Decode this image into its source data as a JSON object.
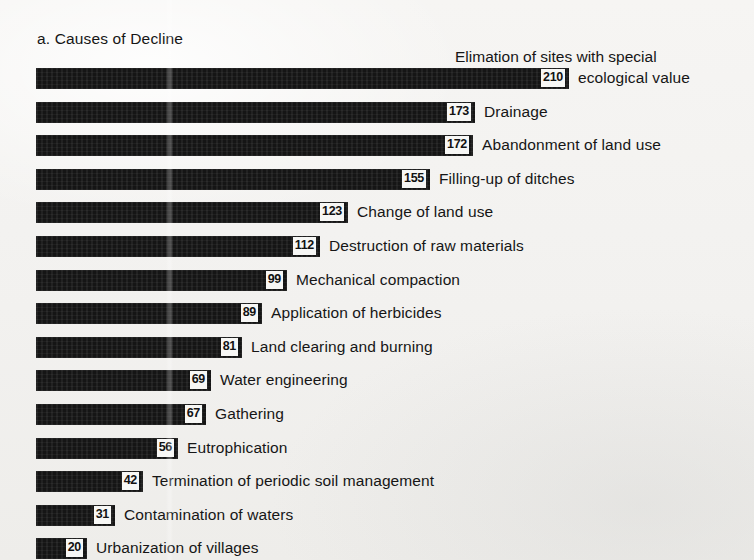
{
  "title": "a. Causes of Decline",
  "first_label_line1": "Elimation of sites with special",
  "colors": {
    "bar": "#151515",
    "background": "#f4f3f1",
    "value_box": "#f7f7f5",
    "text": "#161616"
  },
  "chart_data": {
    "type": "bar",
    "orientation": "horizontal",
    "title": "a. Causes of Decline",
    "xlabel": "",
    "ylabel": "",
    "xlim": [
      0,
      210
    ],
    "grid": false,
    "legend": "none",
    "categories": [
      "Elimation of sites with special ecological value",
      "Drainage",
      "Abandonment of land use",
      "Filling-up of ditches",
      "Change of land use",
      "Destruction of raw materials",
      "Mechanical compaction",
      "Application of herbicides",
      "Land clearing and burning",
      "Water engineering",
      "Gathering",
      "Eutrophication",
      "Termination of periodic soil management",
      "Contamination of waters",
      "Urbanization of villages"
    ],
    "values": [
      210,
      173,
      172,
      155,
      123,
      112,
      99,
      89,
      81,
      69,
      67,
      56,
      42,
      31,
      20
    ]
  },
  "rows": [
    {
      "value": "210",
      "label": "ecological value",
      "label_wrapped": true
    },
    {
      "value": "173",
      "label": "Drainage",
      "label_wrapped": false
    },
    {
      "value": "172",
      "label": "Abandonment of land use",
      "label_wrapped": false
    },
    {
      "value": "155",
      "label": "Filling-up of ditches",
      "label_wrapped": false
    },
    {
      "value": "123",
      "label": "Change of land use",
      "label_wrapped": false
    },
    {
      "value": "112",
      "label": "Destruction of raw materials",
      "label_wrapped": false
    },
    {
      "value": "99",
      "label": "Mechanical compaction",
      "label_wrapped": false
    },
    {
      "value": "89",
      "label": "Application of herbicides",
      "label_wrapped": false
    },
    {
      "value": "81",
      "label": "Land clearing and burning",
      "label_wrapped": false
    },
    {
      "value": "69",
      "label": "Water engineering",
      "label_wrapped": false
    },
    {
      "value": "67",
      "label": "Gathering",
      "label_wrapped": false
    },
    {
      "value": "56",
      "label": "Eutrophication",
      "label_wrapped": false
    },
    {
      "value": "42",
      "label": "Termination of periodic soil management",
      "label_wrapped": false
    },
    {
      "value": "31",
      "label": "Contamination of waters",
      "label_wrapped": false
    },
    {
      "value": "20",
      "label": "Urbanization of villages",
      "label_wrapped": false
    }
  ],
  "layout": {
    "bar_origin_x": 36,
    "px_per_unit": 2.54,
    "first_row_top": 67,
    "row_spacing": 33.6
  }
}
